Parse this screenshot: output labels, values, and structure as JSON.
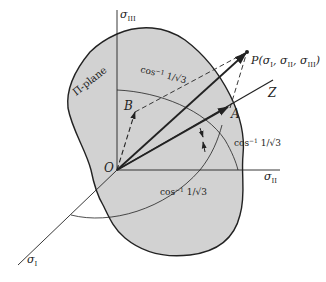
{
  "figure": {
    "type": "principal stress space diagram",
    "colors": {
      "background": "#ffffff",
      "plane_fill": "#d2d2d2",
      "line": "#222222"
    },
    "axes": {
      "sigma_I": {
        "base": "σ",
        "sub": "I"
      },
      "sigma_II": {
        "base": "σ",
        "sub": "II"
      },
      "sigma_III": {
        "base": "σ",
        "sub": "III"
      }
    },
    "points": {
      "origin": "O",
      "P": "P(σ",
      "P_full": "P(σI, σII, σIII)",
      "A": "A",
      "B": "B",
      "Z": "Z"
    },
    "plane_label": "Π-plane",
    "angle_labels": [
      {
        "text": "cos",
        "exp": "−1",
        "rest": " 1/√3",
        "position": "top arc"
      },
      {
        "text": "cos",
        "exp": "−1",
        "rest": " 1/√3",
        "position": "right of Z"
      },
      {
        "text": "cos",
        "exp": "−1",
        "rest": " 1/√3",
        "position": "bottom"
      }
    ]
  }
}
